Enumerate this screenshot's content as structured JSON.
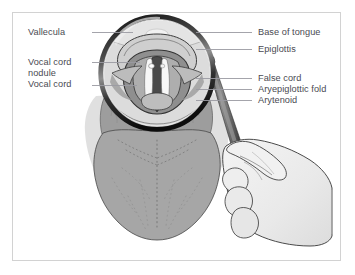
{
  "figure": {
    "type": "anatomical-diagram",
    "width": 355,
    "height": 275,
    "frame_color": "#d2d2d2",
    "background_color": "#ffffff"
  },
  "labels": {
    "left": [
      {
        "id": "vallecula",
        "text": "Vallecula",
        "x": 28,
        "y": 27,
        "leader_from_x": 92,
        "leader_to_x": 133,
        "leader_y": 32
      },
      {
        "id": "vocal-cord-nodule-line1",
        "text": "Vocal cord",
        "x": 28,
        "y": 57,
        "leader_from_x": 92,
        "leader_to_x": 140,
        "leader_y": 62
      },
      {
        "id": "vocal-cord-nodule-line2",
        "text": "nodule",
        "x": 28,
        "y": 68,
        "leader_from_x": null,
        "leader_to_x": null,
        "leader_y": null
      },
      {
        "id": "vocal-cord",
        "text": "Vocal cord",
        "x": 28,
        "y": 79,
        "leader_from_x": 92,
        "leader_to_x": 137,
        "leader_y": 85
      }
    ],
    "right": [
      {
        "id": "base-of-tongue",
        "text": "Base of tongue",
        "x": 258,
        "y": 27,
        "leader_from_x": 196,
        "leader_to_x": 252,
        "leader_y": 32
      },
      {
        "id": "epiglottis",
        "text": "Epiglottis",
        "x": 258,
        "y": 44,
        "leader_from_x": 196,
        "leader_to_x": 252,
        "leader_y": 49
      },
      {
        "id": "false-cord",
        "text": "False cord",
        "x": 258,
        "y": 73,
        "leader_from_x": 196,
        "leader_to_x": 252,
        "leader_y": 78
      },
      {
        "id": "aryepiglottic-fold",
        "text": "Aryepiglottic fold",
        "x": 258,
        "y": 84,
        "leader_from_x": 196,
        "leader_to_x": 252,
        "leader_y": 89
      },
      {
        "id": "arytenoid",
        "text": "Arytenoid",
        "x": 258,
        "y": 95,
        "leader_from_x": 196,
        "leader_to_x": 252,
        "leader_y": 100
      }
    ]
  },
  "colors": {
    "label_text": "#4a4a52",
    "leader_line": "#9a9aa2",
    "outline": "#3a3a3a",
    "tongue_fill": "#a2a2a2",
    "tongue_shadow": "#dcdcdc",
    "larynx_pale": "#d8d8d8",
    "larynx_mid": "#b4b4b4",
    "glottis_dark": "#5c5c5c",
    "vocal_cord_white": "#f6f6f6",
    "mirror_rim_dark": "#1a1a1a",
    "mirror_glass": "#e8e8e8",
    "hand_fill": "#ececec",
    "handle_dark": "#555555"
  },
  "structures": [
    {
      "name": "magnifier-circle",
      "description": "Circular magnified inset showing laryngeal view",
      "cx": 157,
      "cy": 73,
      "r": 58
    },
    {
      "name": "tongue",
      "description": "Protruded tongue body with dotted midline groove"
    },
    {
      "name": "hand",
      "description": "Hand holding laryngeal mirror handle"
    },
    {
      "name": "mirror-stem",
      "description": "Angled laryngeal mirror stem from circle edge to hand"
    },
    {
      "name": "vocal-cords",
      "description": "Pair of white vocal cords flanking dark glottic airway"
    },
    {
      "name": "nodule",
      "description": "Small pale nodule on left vocal cord free edge"
    }
  ]
}
